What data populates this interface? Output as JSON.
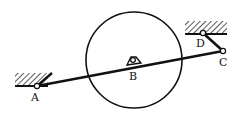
{
  "diagram": {
    "type": "mechanism-linkage",
    "colors": {
      "ink": "#111111",
      "background": "#ffffff"
    },
    "disk": {
      "cx": 134,
      "cy": 60,
      "r": 48
    },
    "points": {
      "A": {
        "label": "A",
        "x": 37,
        "y": 86,
        "label_x": 31,
        "label_y": 101
      },
      "B": {
        "label": "B",
        "x": 133,
        "y": 60,
        "label_x": 129,
        "label_y": 80
      },
      "C": {
        "label": "C",
        "x": 223,
        "y": 51,
        "label_x": 219,
        "label_y": 66
      },
      "D": {
        "label": "D",
        "x": 203,
        "y": 33,
        "label_x": 196,
        "label_y": 47
      }
    },
    "supports": [
      {
        "name": "support-A",
        "ground_x1": 15,
        "ground_x2": 48,
        "ground_y": 86
      },
      {
        "name": "support-D",
        "ground_x1": 185,
        "ground_x2": 227,
        "ground_y": 34
      }
    ],
    "links": [
      {
        "name": "rod-AC",
        "from": "A",
        "to": "C"
      },
      {
        "name": "link-DC",
        "from": "D",
        "to": "C"
      }
    ]
  }
}
